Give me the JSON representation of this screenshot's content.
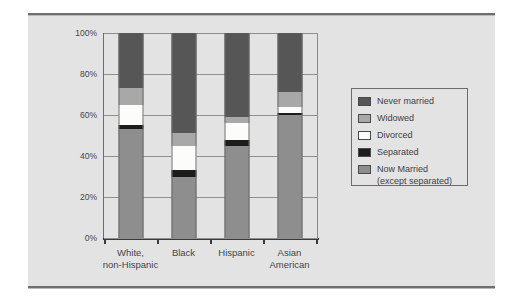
{
  "chart_data": {
    "type": "bar",
    "subtype": "stacked-percent-bar",
    "title": "",
    "subtitle": "",
    "xlabel": "",
    "ylabel": "",
    "ylim": [
      0,
      100
    ],
    "yticks": [
      0,
      20,
      40,
      60,
      80,
      100
    ],
    "ytick_labels": [
      "0%",
      "20%",
      "40%",
      "60%",
      "80%",
      "100%"
    ],
    "grid": true,
    "legend_position": "right-outside",
    "categories": [
      "White, non-Hispanic",
      "Black",
      "Hispanic",
      "Asian American"
    ],
    "category_lines": [
      [
        "White,",
        "non-Hispanic"
      ],
      [
        "Black"
      ],
      [
        "Hispanic"
      ],
      [
        "Asian",
        "American"
      ]
    ],
    "series": [
      {
        "name": "Now Married (except separated)",
        "legend_label_lines": [
          "Now Married",
          "(except separated)"
        ],
        "color": "#8e8e8e",
        "values": [
          53,
          30,
          45,
          60
        ]
      },
      {
        "name": "Separated",
        "legend_label_lines": [
          "Separated"
        ],
        "color": "#1c1c1c",
        "values": [
          2,
          3,
          3,
          1
        ]
      },
      {
        "name": "Divorced",
        "legend_label_lines": [
          "Divorced"
        ],
        "color": "#fcfcfa",
        "values": [
          10,
          12,
          8,
          3
        ]
      },
      {
        "name": "Widowed",
        "legend_label_lines": [
          "Widowed"
        ],
        "color": "#a8a8a8",
        "values": [
          8,
          6,
          3,
          7
        ]
      },
      {
        "name": "Never married",
        "legend_label_lines": [
          "Never married"
        ],
        "color": "#565656",
        "values": [
          27,
          49,
          41,
          29
        ]
      }
    ],
    "stack_boundaries_pct": {
      "White, non-Hispanic": [
        0,
        53,
        55,
        65,
        73,
        100
      ],
      "Black": [
        0,
        30,
        33,
        45,
        51,
        100
      ],
      "Hispanic": [
        0,
        45,
        48,
        56,
        59,
        100
      ],
      "Asian American": [
        0,
        60,
        61,
        64,
        71,
        100
      ]
    }
  },
  "legend": {
    "items": [
      {
        "label": "Never married",
        "label_2": "",
        "color": "#565656"
      },
      {
        "label": "Widowed",
        "label_2": "",
        "color": "#a8a8a8"
      },
      {
        "label": "Divorced",
        "label_2": "",
        "color": "#fcfcfa"
      },
      {
        "label": "Separated",
        "label_2": "",
        "color": "#1c1c1c"
      },
      {
        "label": "Now Married",
        "label_2": "(except separated)",
        "color": "#8e8e8e"
      }
    ]
  },
  "axis": {
    "y_labels": [
      "100%",
      "80%",
      "60%",
      "40%",
      "20%",
      "0%"
    ],
    "x_labels": [
      {
        "line1": "White,",
        "line2": "non-Hispanic"
      },
      {
        "line1": "Black",
        "line2": ""
      },
      {
        "line1": "Hispanic",
        "line2": ""
      },
      {
        "line1": "Asian",
        "line2": "American"
      }
    ]
  },
  "colors": {
    "panel_background": "#e3e3e3",
    "page_background": "#ffffff",
    "rule": "#6e6e75",
    "gridline": "#8f8f8f",
    "axis": "#39393c",
    "text": "#45454a"
  }
}
